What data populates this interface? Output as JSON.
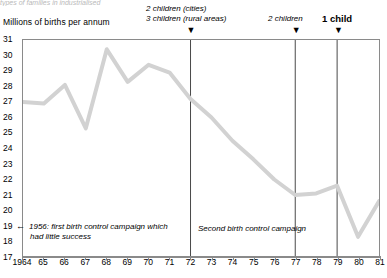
{
  "top_cut_text": "types of families in industrialised",
  "axis": {
    "y_title": "Millions of births per annum",
    "y_ticks": [
      31,
      30,
      29,
      28,
      27,
      26,
      25,
      24,
      23,
      22,
      21,
      20,
      19,
      18,
      17
    ],
    "x_ticks": [
      "1964",
      "65",
      "66",
      "67",
      "68",
      "69",
      "70",
      "71",
      "72",
      "73",
      "74",
      "75",
      "76",
      "77",
      "78",
      "79",
      "80",
      "81"
    ]
  },
  "markers": [
    {
      "id": "marker-1972",
      "label_line1": "2 children (cities)",
      "label_line2": "3 children (rural areas)",
      "year": 72,
      "arrow": "▼",
      "bold": false
    },
    {
      "id": "marker-1977",
      "label_line1": "2 children",
      "label_line2": "",
      "year": 77,
      "arrow": "▼",
      "bold": false
    },
    {
      "id": "marker-1979",
      "label_line1": "1 child",
      "label_line2": "",
      "year": 79,
      "arrow": "▼",
      "bold": true
    }
  ],
  "annotations": [
    {
      "id": "annotation-1956",
      "arrow": "←",
      "line1": "1956: first birth control campaign which",
      "line2": "had little success"
    },
    {
      "id": "annotation-second-campaign",
      "arrow": "",
      "line1": "Second birth control campaign",
      "line2": ""
    }
  ],
  "colors": {
    "line": "#d2d2d2",
    "axis": "#8a8a8a",
    "marker_line": "#4a4a4a",
    "text": "#000000"
  },
  "chart_data": {
    "type": "line",
    "title": "",
    "xlabel": "",
    "ylabel": "Millions of births per annum",
    "ylim": [
      17,
      31
    ],
    "xlim": [
      1964,
      1981
    ],
    "grid": false,
    "legend": "none",
    "x": [
      1964,
      1965,
      1966,
      1967,
      1968,
      1969,
      1970,
      1971,
      1972,
      1973,
      1974,
      1975,
      1976,
      1977,
      1978,
      1979,
      1980,
      1981
    ],
    "values": [
      27.0,
      26.9,
      28.1,
      25.3,
      30.4,
      28.3,
      29.4,
      28.9,
      27.2,
      26.0,
      24.5,
      23.3,
      22.0,
      21.0,
      21.1,
      21.6,
      18.3,
      20.6
    ],
    "series": [
      {
        "name": "Births per annum",
        "values": [
          27.0,
          26.9,
          28.1,
          25.3,
          30.4,
          28.3,
          29.4,
          28.9,
          27.2,
          26.0,
          24.5,
          23.3,
          22.0,
          21.0,
          21.1,
          21.6,
          18.3,
          20.6
        ]
      }
    ],
    "vertical_markers": [
      {
        "x": 1972,
        "label": "2 children (cities) / 3 children (rural areas)"
      },
      {
        "x": 1977,
        "label": "2 children"
      },
      {
        "x": 1979,
        "label": "1 child"
      }
    ],
    "annotations": [
      {
        "text": "1956: first birth control campaign which had little success",
        "x": 1965,
        "y": 18.3
      },
      {
        "text": "Second birth control campaign",
        "x": 1974,
        "y": 18.5
      }
    ]
  }
}
